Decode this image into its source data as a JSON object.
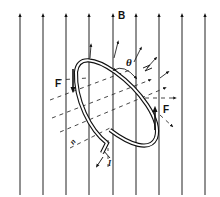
{
  "diagram": {
    "labels": {
      "field": "B",
      "angle": "θ",
      "force_left": "F",
      "force_right": "F",
      "normal": "n",
      "current": "I"
    },
    "field_lines_x": [
      20,
      43,
      66,
      89,
      113,
      136,
      159,
      182,
      205
    ],
    "colors": {
      "ink": "#111111",
      "background": "#ffffff"
    }
  }
}
